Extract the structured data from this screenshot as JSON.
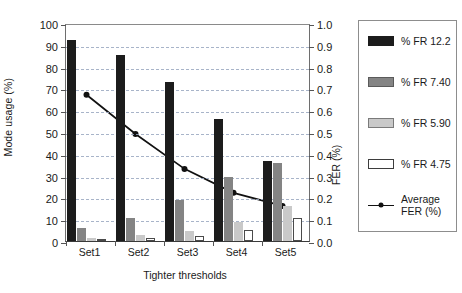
{
  "chart_data": {
    "type": "bar",
    "title": "",
    "subtitle": "",
    "xlabel": "Tighter thresholds",
    "ylabel": "Mode usage (%)",
    "y2label": "FER (%)",
    "categories": [
      "Set1",
      "Set2",
      "Set3",
      "Set4",
      "Set5"
    ],
    "ylim": [
      0,
      100
    ],
    "y2lim": [
      0.0,
      1.0
    ],
    "yticks": [
      "0",
      "10",
      "20",
      "30",
      "40",
      "50",
      "60",
      "70",
      "80",
      "90",
      "100"
    ],
    "y2ticks": [
      "0.0",
      "0.1",
      "0.2",
      "0.3",
      "0.4",
      "0.5",
      "0.6",
      "0.7",
      "0.8",
      "0.9",
      "1.0"
    ],
    "grid": true,
    "legend_position": "right",
    "series": [
      {
        "name": "% FR 12.2",
        "type": "bar",
        "axis": "left",
        "color": "#1c1c1c",
        "values": [
          92.2,
          85.4,
          73.0,
          55.8,
          36.6
        ]
      },
      {
        "name": "% FR 7.40",
        "type": "bar",
        "axis": "left",
        "color": "#848484",
        "values": [
          5.9,
          10.5,
          18.9,
          29.4,
          35.6
        ]
      },
      {
        "name": "% FR 5.90",
        "type": "bar",
        "axis": "left",
        "color": "#c9c9c9",
        "values": [
          1.2,
          2.6,
          4.6,
          8.9,
          16.0
        ]
      },
      {
        "name": "% FR 4.75",
        "type": "bar",
        "axis": "left",
        "color": "#ffffff",
        "values": [
          0.8,
          1.4,
          2.5,
          5.2,
          10.4
        ]
      },
      {
        "name": "Average FER (%)",
        "type": "line",
        "axis": "right",
        "color": "#111111",
        "values": [
          0.68,
          0.5,
          0.34,
          0.23,
          0.17
        ]
      }
    ]
  },
  "legend": {
    "items": [
      {
        "label": "% FR 12.2",
        "marker": "swatch-dark"
      },
      {
        "label": "% FR 7.40",
        "marker": "swatch-gray"
      },
      {
        "label": "% FR 5.90",
        "marker": "swatch-lightgray"
      },
      {
        "label": "% FR 4.75",
        "marker": "swatch-white"
      },
      {
        "label": "Average\nFER (%)",
        "label_line1": "Average",
        "label_line2": "FER (%)",
        "marker": "line-dot"
      }
    ]
  }
}
